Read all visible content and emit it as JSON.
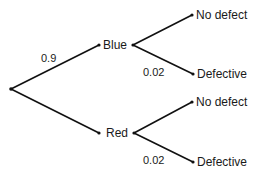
{
  "diagram": {
    "type": "probability-tree",
    "root": {
      "x": 11,
      "y": 89
    },
    "first_level": [
      {
        "label": "Blue",
        "probability": "0.9",
        "node": {
          "x": 99,
          "y": 45
        },
        "branches": [
          {
            "label": "No defect",
            "probability": "",
            "node": {
              "x": 192,
              "y": 15
            }
          },
          {
            "label": "Defective",
            "probability": "0.02",
            "node": {
              "x": 193,
              "y": 74
            }
          }
        ]
      },
      {
        "label": "Red",
        "probability": "",
        "node": {
          "x": 99,
          "y": 133
        },
        "branches": [
          {
            "label": "No defect",
            "probability": "",
            "node": {
              "x": 192,
              "y": 102
            }
          },
          {
            "label": "Defective",
            "probability": "0.02",
            "node": {
              "x": 193,
              "y": 162
            }
          }
        ]
      }
    ]
  }
}
